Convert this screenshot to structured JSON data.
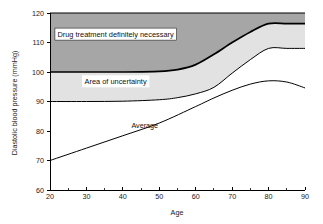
{
  "chart_data": {
    "type": "area",
    "title": "",
    "xlabel": "Age",
    "ylabel": "Diastolic blood pressure (mmHg)",
    "xlim": [
      20,
      90
    ],
    "ylim": [
      60,
      120
    ],
    "xticks": [
      20,
      30,
      40,
      50,
      60,
      70,
      80,
      90
    ],
    "xticks_minor": [
      25,
      35,
      45,
      55,
      65,
      75,
      85
    ],
    "yticks": [
      60,
      70,
      80,
      90,
      100,
      110,
      120
    ],
    "grid": false,
    "legend": "none",
    "annotations": [
      {
        "name": "drug-treatment-label",
        "text": "Drug treatment definitely necessary",
        "x": 38,
        "y": 112
      },
      {
        "name": "area-uncertainty-label",
        "text": "Area of uncertainty",
        "x": 38,
        "y": 96
      },
      {
        "name": "average-label",
        "text": "Average",
        "x": 46,
        "y": 81
      }
    ],
    "series": [
      {
        "name": "Top of chart (120 reference)",
        "role": "upper-frame",
        "x": [
          20,
          90
        ],
        "values": [
          120,
          120
        ]
      },
      {
        "name": "Upper boundary of drug treatment band",
        "role": "band-upper",
        "x": [
          20,
          30,
          40,
          50,
          55,
          60,
          65,
          70,
          75,
          80,
          85,
          90
        ],
        "values": [
          100,
          100,
          100,
          100.2,
          100.8,
          102.5,
          106,
          110,
          113.6,
          116.4,
          116.4,
          116.4
        ]
      },
      {
        "name": "Lower boundary of area of uncertainty",
        "role": "band-lower",
        "x": [
          20,
          30,
          40,
          50,
          55,
          60,
          65,
          70,
          75,
          80,
          85,
          90
        ],
        "values": [
          90,
          90,
          90.1,
          90.6,
          91.3,
          92.6,
          94.8,
          99.6,
          104.2,
          108,
          108,
          108
        ]
      },
      {
        "name": "Average",
        "role": "line",
        "x": [
          20,
          30,
          40,
          50,
          60,
          65,
          70,
          75,
          80,
          85,
          90
        ],
        "values": [
          70,
          74.2,
          78.4,
          82.7,
          88.3,
          91.2,
          93.8,
          95.9,
          97,
          96.6,
          94.6
        ]
      }
    ],
    "bands": [
      {
        "name": "Drug treatment definitely necessary",
        "fill": "#a6a6a6",
        "lower_series": "Upper boundary of drug treatment band",
        "upper_series": "Top of chart (120 reference)"
      },
      {
        "name": "Area of uncertainty",
        "fill": "#e2e2e2",
        "lower_series": "Lower boundary of area of uncertainty",
        "upper_series": "Upper boundary of drug treatment band"
      }
    ]
  },
  "axes": {
    "x_title": "Age",
    "y_title": "Diastolic blood pressure (mmHg)",
    "x_tick_labels": [
      "20",
      "30",
      "40",
      "50",
      "60",
      "70",
      "80",
      "90"
    ],
    "y_tick_labels": [
      "60",
      "70",
      "80",
      "90",
      "100",
      "110",
      "120"
    ]
  },
  "colors": {
    "band_dark": "#a6a6a6",
    "band_light": "#e2e2e2",
    "axis": "#000000",
    "background": "#ffffff",
    "text": "#111111"
  }
}
